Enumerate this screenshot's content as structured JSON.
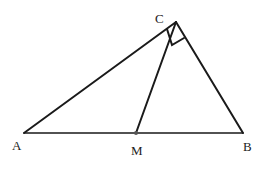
{
  "diagram": {
    "type": "geometry-triangle",
    "points": {
      "A": {
        "label": "A",
        "x": 24,
        "y": 133
      },
      "B": {
        "label": "B",
        "x": 243,
        "y": 133
      },
      "C": {
        "label": "C",
        "x": 176,
        "y": 22
      },
      "M": {
        "label": "M",
        "x": 136,
        "y": 133
      }
    },
    "segments": [
      "AC",
      "CB",
      "AB",
      "CM"
    ],
    "right_angle_at": "C",
    "midpoint": "M",
    "colors": {
      "stroke": "#1a1a1a",
      "label": "#222222",
      "background": "#ffffff"
    }
  }
}
